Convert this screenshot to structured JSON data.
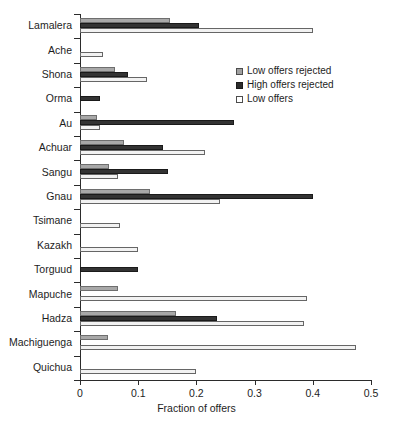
{
  "chart_data": {
    "type": "bar",
    "orientation": "horizontal",
    "title": "",
    "xlabel": "Fraction of offers",
    "ylabel": "",
    "xlim": [
      0,
      0.5
    ],
    "xticks": [
      "0",
      "0.1",
      "0.2",
      "0.3",
      "0.4",
      "0.5"
    ],
    "xtick_values": [
      0,
      0.1,
      0.2,
      0.3,
      0.4,
      0.5
    ],
    "grid": false,
    "legend_position": "upper right",
    "categories": [
      "Lamalera",
      "Ache",
      "Shona",
      "Orma",
      "Au",
      "Achuar",
      "Sangu",
      "Gnau",
      "Tsimane",
      "Kazakh",
      "Torguud",
      "Mapuche",
      "Hadza",
      "Machiguenga",
      "Quichua"
    ],
    "series": [
      {
        "name": "Low offers rejected",
        "color": "#a8a8a8",
        "values": [
          0.155,
          0.0,
          0.06,
          0.0,
          0.03,
          0.075,
          0.05,
          0.12,
          0.0,
          0.0,
          0.0,
          0.065,
          0.165,
          0.048,
          0.0
        ]
      },
      {
        "name": "High offers rejected",
        "color": "#333333",
        "values": [
          0.205,
          0.0,
          0.082,
          0.035,
          0.265,
          0.142,
          0.152,
          0.4,
          0.0,
          0.0,
          0.1,
          0.0,
          0.235,
          0.0,
          0.0
        ]
      },
      {
        "name": "Low offers",
        "color": "#f2f2f2",
        "values": [
          0.4,
          0.04,
          0.115,
          0.0,
          0.035,
          0.215,
          0.065,
          0.24,
          0.068,
          0.1,
          0.0,
          0.39,
          0.385,
          0.475,
          0.2
        ]
      }
    ]
  },
  "legend": {
    "items": [
      {
        "label": "Low offers rejected",
        "swatch": "gray"
      },
      {
        "label": "High offers rejected",
        "swatch": "black"
      },
      {
        "label": "Low offers",
        "swatch": "white"
      }
    ]
  },
  "axis": {
    "x_title": "Fraction of offers"
  }
}
